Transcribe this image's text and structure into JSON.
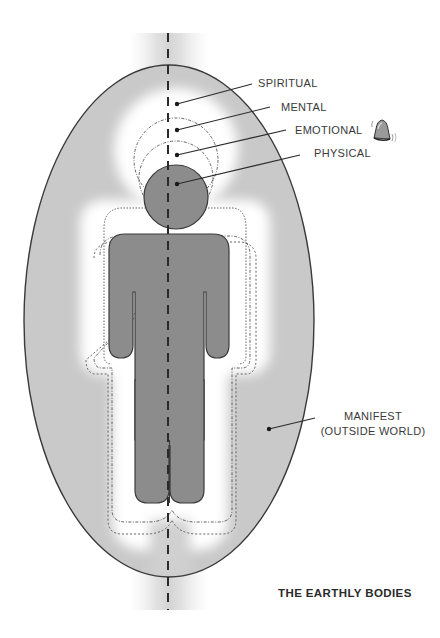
{
  "figure": {
    "title": "THE EARTHLY BODIES"
  },
  "labels": {
    "spiritual": "SPIRITUAL",
    "mental": "MENTAL",
    "emotional": "EMOTIONAL",
    "physical": "PHYSICAL",
    "manifest_line1": "MANIFEST",
    "manifest_line2": "(OUTSIDE WORLD)"
  },
  "icons": {
    "bell": "ringing-bell-icon"
  },
  "colors": {
    "background": "#ffffff",
    "manifest_field": "#c9c9c9",
    "body_fill": "#8c8c8c",
    "aura_glow": "#f4f4f4",
    "outline": "#3a3a3a",
    "text": "#3a3a3a"
  }
}
